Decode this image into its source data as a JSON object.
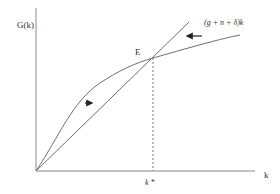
{
  "diagram": {
    "y_axis_label": "G(k)",
    "x_axis_label": "k",
    "equilibrium_label": "E",
    "steady_state_label": "k *",
    "line_label": "(g + n + δ)k",
    "colors": {
      "axis": "#8a8a8a",
      "curve": "#6f6f6f",
      "line": "#6f6f6f",
      "dashed": "#7a7a7a",
      "arrow": "#222222",
      "text": "#333333"
    },
    "arrows": [
      {
        "name": "arrow-right",
        "direction": "right"
      },
      {
        "name": "arrow-left",
        "direction": "left"
      }
    ]
  }
}
